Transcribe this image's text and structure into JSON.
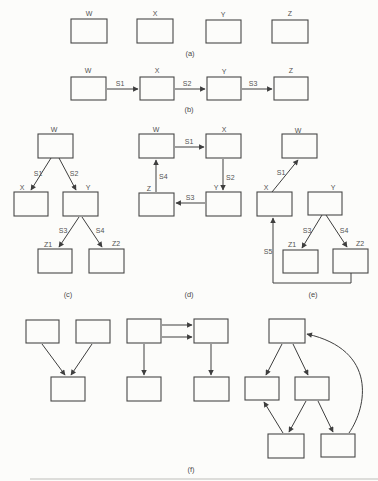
{
  "colors": {
    "background": "#fcfcfa",
    "line": "#3e3e3e",
    "text": "#525252"
  },
  "panels": {
    "a": {
      "caption": "(a)",
      "nodes": {
        "w": "W",
        "x": "X",
        "y": "Y",
        "z": "Z"
      }
    },
    "b": {
      "caption": "(b)",
      "nodes": {
        "w": "W",
        "x": "X",
        "y": "Y",
        "z": "Z"
      },
      "edges": {
        "s1": "S1",
        "s2": "S2",
        "s3": "S3"
      }
    },
    "c": {
      "caption": "(c)",
      "nodes": {
        "w": "W",
        "x": "X",
        "y": "Y",
        "z1": "Z1",
        "z2": "Z2"
      },
      "edges": {
        "s1": "S1",
        "s2": "S2",
        "s3": "S3",
        "s4": "S4"
      }
    },
    "d": {
      "caption": "(d)",
      "nodes": {
        "w": "W",
        "x": "X",
        "y": "Y",
        "z": "Z"
      },
      "edges": {
        "s1": "S1",
        "s2": "S2",
        "s3": "S3",
        "s4": "S4"
      }
    },
    "e": {
      "caption": "(e)",
      "nodes": {
        "w": "W",
        "x": "X",
        "y": "Y",
        "z1": "Z1",
        "z2": "Z2"
      },
      "edges": {
        "s1": "S1",
        "s3": "S3",
        "s4": "S4",
        "s5": "S5"
      }
    },
    "f": {
      "caption": "(f)"
    }
  }
}
